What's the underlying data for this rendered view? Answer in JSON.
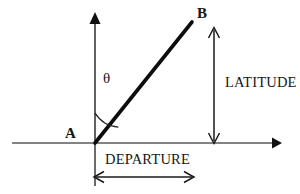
{
  "diagram": {
    "background_color": "#ffffff",
    "stroke_color": "#161616",
    "axis_color": "#5a5a5a",
    "points": {
      "a_label": "A",
      "b_label": "B"
    },
    "angle": {
      "symbol": "θ",
      "name": "theta",
      "description": "bearing angle from the vertical axis to line AB"
    },
    "dimensions": {
      "vertical_label": "LATITUDE",
      "horizontal_label": "DEPARTURE"
    },
    "geometry": {
      "origin_x": 95,
      "origin_y": 143,
      "line_end_x": 192,
      "line_end_y": 22,
      "vertical_axis_top_y": 13,
      "horizontal_axis_left_x": 12,
      "horizontal_axis_right_x": 280,
      "latitude_arrow_x": 214,
      "latitude_arrow_top_y": 28,
      "departure_arrow_y": 177,
      "departure_arrow_left_x": 95,
      "departure_arrow_right_x": 193,
      "angle_arc_radius": 28
    }
  }
}
